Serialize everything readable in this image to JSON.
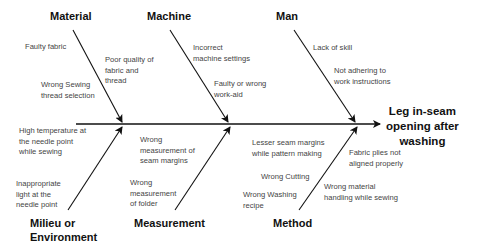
{
  "diagram": {
    "type": "fishbone",
    "effect": [
      "Leg in-seam",
      "opening after",
      "washing"
    ],
    "categories": {
      "material": "Material",
      "machine": "Machine",
      "man": "Man",
      "milieu": [
        "Milieu or",
        "Environment"
      ],
      "measurement": "Measurement",
      "method": "Method"
    },
    "causes": {
      "material": [
        [
          "Faulty fabric"
        ],
        [
          "Poor quality of",
          "fabric and",
          "thread"
        ],
        [
          "Wrong Sewing",
          "thread selection"
        ]
      ],
      "machine": [
        [
          "Incorrect",
          "machine settings"
        ],
        [
          "Faulty or wrong",
          "work-aid"
        ]
      ],
      "man": [
        [
          "Lack of skill"
        ],
        [
          "Not adhering to",
          "work instructions"
        ]
      ],
      "milieu": [
        [
          "High temperature at",
          "the needle point",
          "while sewing"
        ],
        [
          "Inappropriate",
          "light at the",
          "needle point"
        ]
      ],
      "measurement": [
        [
          "Wrong",
          "measurement of",
          "seam margins"
        ],
        [
          "Wrong",
          "measurement",
          "of folder"
        ]
      ],
      "method": [
        [
          "Lesser seam margins",
          "while pattern making"
        ],
        [
          "Fabric plies not",
          "aligned properly"
        ],
        [
          "Wrong Cutting"
        ],
        [
          "Wrong Washing",
          "recipe"
        ],
        [
          "Wrong material",
          "handling while sewing"
        ]
      ]
    }
  }
}
